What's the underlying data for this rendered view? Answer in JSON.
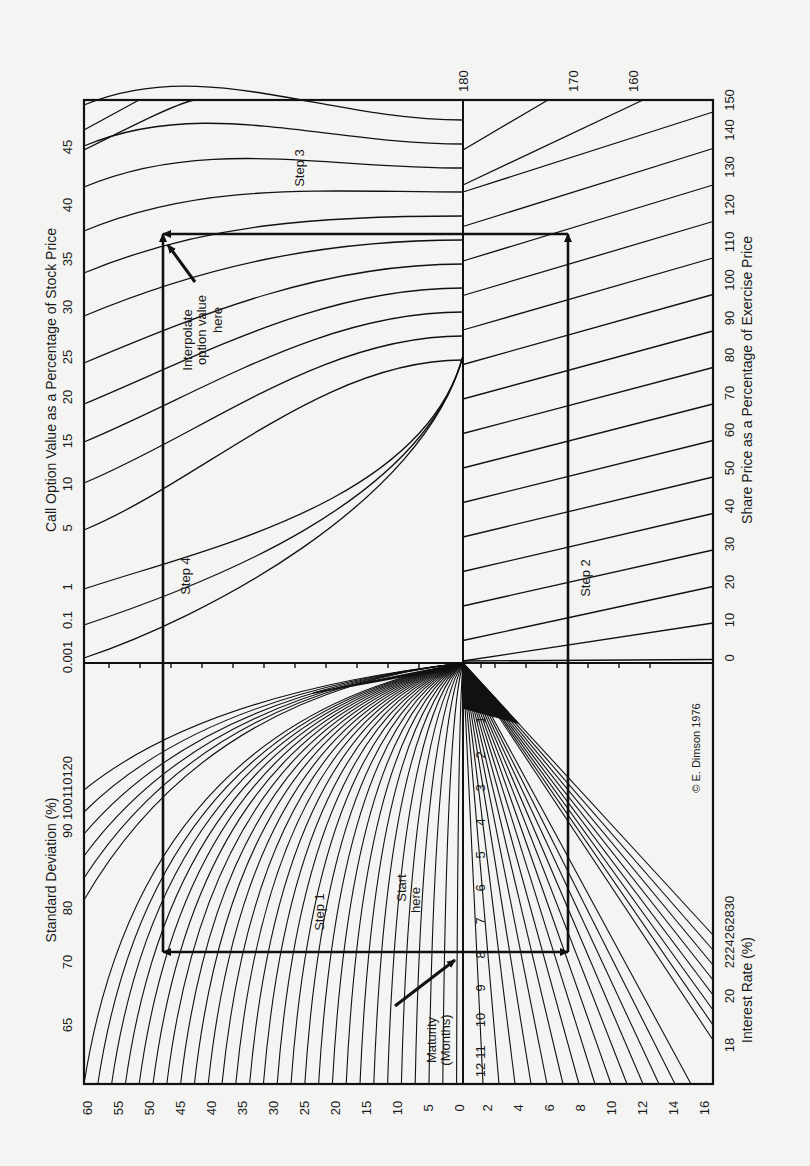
{
  "chart_data": {
    "type": "nomogram",
    "copyright": "© E. Dimson 1976",
    "axes": {
      "call_option_value": {
        "label": "Call Option Value as a Percentage of Stock Price",
        "ticks": [
          "0.001",
          "0.1",
          "1",
          "5",
          "10",
          "15",
          "20",
          "25",
          "30",
          "35",
          "40",
          "45"
        ]
      },
      "standard_deviation": {
        "label": "Standard Deviation (%)",
        "ticks": [
          "65",
          "70",
          "80",
          "90",
          "100",
          "110",
          "120"
        ]
      },
      "share_price": {
        "label": "Share Price as a Percentage of Exercise Price",
        "ticks": [
          "0",
          "10",
          "20",
          "30",
          "40",
          "50",
          "60",
          "70",
          "80",
          "90",
          "100",
          "110",
          "120",
          "130",
          "140",
          "150"
        ],
        "top_ticks": [
          "180",
          "170",
          "160"
        ]
      },
      "interest_rate": {
        "label": "Interest Rate (%)",
        "ticks": [
          "18",
          "20",
          "22",
          "24",
          "26",
          "28",
          "30"
        ]
      },
      "bottom_scale_left": [
        "60",
        "55",
        "50",
        "45",
        "40",
        "35",
        "30",
        "25",
        "20",
        "15",
        "10",
        "5",
        "0"
      ],
      "bottom_scale_right": [
        "2",
        "4",
        "6",
        "8",
        "10",
        "12",
        "14",
        "16"
      ],
      "maturity": {
        "label": "Maturity (Months)",
        "ticks": [
          "1",
          "2",
          "3",
          "4",
          "5",
          "6",
          "7",
          "8",
          "9",
          "10",
          "11",
          "12"
        ]
      }
    },
    "annotations": {
      "start": "Start here",
      "interpolate_line1": "Interpolate",
      "interpolate_line2": "option value",
      "interpolate_line3": "here",
      "start_line1": "Start",
      "start_line2": "here",
      "maturity_line1": "Maturity",
      "maturity_line2": "(Months)",
      "step1": "Step 1",
      "step2": "Step 2",
      "step3": "Step 3",
      "step4": "Step 4"
    },
    "example_path": {
      "maturity_months": 8,
      "description": "Start at maturity 8 → Step 1 left to SD curve → Step 4 up to option curve; Step 2 right to interest rate line → Step 3 up to share price line → horizontal to option value ≈ 37%"
    }
  }
}
